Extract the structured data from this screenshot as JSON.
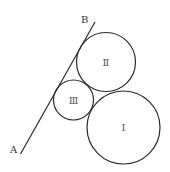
{
  "diagram": {
    "width": 170,
    "height": 172,
    "stroke_color": "#2a2a2a",
    "line": {
      "name": "AB",
      "x1": 20.5,
      "y1": 154,
      "x2": 95,
      "y2": 22,
      "start_label": {
        "text": "A",
        "x": 10,
        "y": 153
      },
      "end_label": {
        "text": "B",
        "x": 81,
        "y": 23
      }
    },
    "circles": [
      {
        "id": "I",
        "label": "Ⅰ",
        "cx": 123.5,
        "cy": 127.5,
        "r": 36.5
      },
      {
        "id": "II",
        "label": "Ⅱ",
        "cx": 106,
        "cy": 62,
        "r": 29.5
      },
      {
        "id": "III",
        "label": "Ⅲ",
        "cx": 73.5,
        "cy": 100,
        "r": 20
      }
    ]
  }
}
